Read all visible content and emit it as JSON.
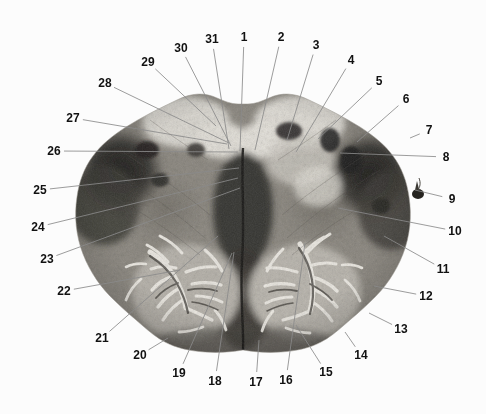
{
  "figure": {
    "kind": "anatomical-histology-cross-section",
    "background_color": "#fcfcfc",
    "label_text_color": "#111111",
    "leader_line_color": "#8a8a8a",
    "width": 486,
    "height": 414
  },
  "labels": [
    {
      "id": "1",
      "text": "1",
      "x": 244,
      "y": 37,
      "tip_x": 240,
      "tip_y": 151
    },
    {
      "id": "2",
      "text": "2",
      "x": 281,
      "y": 37,
      "tip_x": 255,
      "tip_y": 150
    },
    {
      "id": "3",
      "text": "3",
      "x": 316,
      "y": 45,
      "tip_x": 287,
      "tip_y": 140
    },
    {
      "id": "4",
      "text": "4",
      "x": 351,
      "y": 60,
      "tip_x": 296,
      "tip_y": 152
    },
    {
      "id": "5",
      "text": "5",
      "x": 379,
      "y": 81,
      "tip_x": 318,
      "tip_y": 139
    },
    {
      "id": "6",
      "text": "6",
      "x": 406,
      "y": 99,
      "tip_x": 357,
      "tip_y": 142
    },
    {
      "id": "7",
      "text": "7",
      "x": 429,
      "y": 130,
      "tip_x": 410,
      "tip_y": 138
    },
    {
      "id": "8",
      "text": "8",
      "x": 446,
      "y": 157,
      "tip_x": 340,
      "tip_y": 153
    },
    {
      "id": "9",
      "text": "9",
      "x": 452,
      "y": 199,
      "tip_x": 415,
      "tip_y": 190
    },
    {
      "id": "10",
      "text": "10",
      "x": 455,
      "y": 231,
      "tip_x": 338,
      "tip_y": 208
    },
    {
      "id": "11",
      "text": "11",
      "x": 443,
      "y": 269,
      "tip_x": 384,
      "tip_y": 236
    },
    {
      "id": "12",
      "text": "12",
      "x": 426,
      "y": 296,
      "tip_x": 374,
      "tip_y": 286
    },
    {
      "id": "13",
      "text": "13",
      "x": 401,
      "y": 329,
      "tip_x": 369,
      "tip_y": 313
    },
    {
      "id": "14",
      "text": "14",
      "x": 361,
      "y": 355,
      "tip_x": 345,
      "tip_y": 332
    },
    {
      "id": "15",
      "text": "15",
      "x": 326,
      "y": 372,
      "tip_x": 296,
      "tip_y": 325
    },
    {
      "id": "16",
      "text": "16",
      "x": 286,
      "y": 380,
      "tip_x": 305,
      "tip_y": 243
    },
    {
      "id": "17",
      "text": "17",
      "x": 256,
      "y": 382,
      "tip_x": 259,
      "tip_y": 340
    },
    {
      "id": "18",
      "text": "18",
      "x": 215,
      "y": 381,
      "tip_x": 234,
      "tip_y": 252
    },
    {
      "id": "19",
      "text": "19",
      "x": 179,
      "y": 373,
      "tip_x": 232,
      "tip_y": 253
    },
    {
      "id": "20",
      "text": "20",
      "x": 140,
      "y": 355,
      "tip_x": 168,
      "tip_y": 338
    },
    {
      "id": "21",
      "text": "21",
      "x": 102,
      "y": 338,
      "tip_x": 218,
      "tip_y": 236
    },
    {
      "id": "22",
      "text": "22",
      "x": 64,
      "y": 291,
      "tip_x": 180,
      "tip_y": 270
    },
    {
      "id": "23",
      "text": "23",
      "x": 47,
      "y": 259,
      "tip_x": 240,
      "tip_y": 188
    },
    {
      "id": "24",
      "text": "24",
      "x": 38,
      "y": 227,
      "tip_x": 238,
      "tip_y": 178
    },
    {
      "id": "25",
      "text": "25",
      "x": 40,
      "y": 190,
      "tip_x": 239,
      "tip_y": 168
    },
    {
      "id": "26",
      "text": "26",
      "x": 54,
      "y": 151,
      "tip_x": 238,
      "tip_y": 152
    },
    {
      "id": "27",
      "text": "27",
      "x": 73,
      "y": 118,
      "tip_x": 227,
      "tip_y": 144
    },
    {
      "id": "28",
      "text": "28",
      "x": 105,
      "y": 83,
      "tip_x": 229,
      "tip_y": 143
    },
    {
      "id": "29",
      "text": "29",
      "x": 148,
      "y": 62,
      "tip_x": 216,
      "tip_y": 126
    },
    {
      "id": "30",
      "text": "30",
      "x": 181,
      "y": 48,
      "tip_x": 231,
      "tip_y": 146
    },
    {
      "id": "31",
      "text": "31",
      "x": 212,
      "y": 39,
      "tip_x": 229,
      "tip_y": 149
    }
  ]
}
